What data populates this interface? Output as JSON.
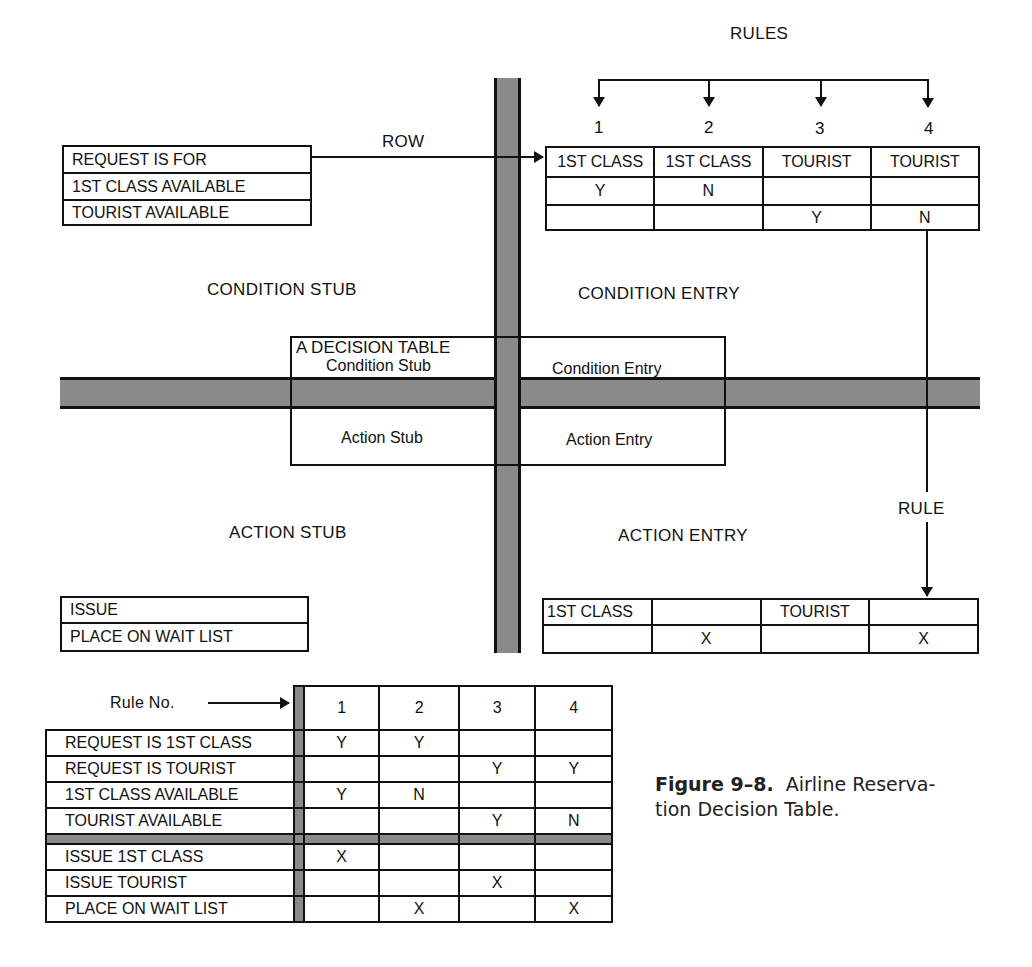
{
  "labels": {
    "rules": "RULES",
    "row": "ROW",
    "rule": "RULE",
    "condition_stub": "CONDITION STUB",
    "condition_entry": "CONDITION ENTRY",
    "action_stub": "ACTION STUB",
    "action_entry": "ACTION ENTRY"
  },
  "rule_numbers": [
    "1",
    "2",
    "3",
    "4"
  ],
  "condition_stub_rows": [
    "REQUEST IS FOR",
    "1ST CLASS AVAILABLE",
    "TOURIST AVAILABLE"
  ],
  "condition_entry_rows": [
    [
      "1ST CLASS",
      "1ST CLASS",
      "TOURIST",
      "TOURIST"
    ],
    [
      "Y",
      "N",
      "",
      ""
    ],
    [
      "",
      "",
      "Y",
      "N"
    ]
  ],
  "center_box": {
    "title": "A DECISION TABLE",
    "condition_stub": "Condition Stub",
    "condition_entry": "Condition Entry",
    "action_stub": "Action Stub",
    "action_entry": "Action Entry"
  },
  "action_stub_rows": [
    "ISSUE",
    "PLACE ON WAIT LIST"
  ],
  "action_entry_rows": [
    [
      "1ST CLASS",
      "",
      "TOURIST",
      ""
    ],
    [
      "",
      "X",
      "",
      "X"
    ]
  ],
  "full_table": {
    "header_label": "Rule No.",
    "rule_numbers": [
      "1",
      "2",
      "3",
      "4"
    ],
    "conditions": [
      {
        "stub": "REQUEST IS 1ST CLASS",
        "entries": [
          "Y",
          "Y",
          "",
          ""
        ]
      },
      {
        "stub": "REQUEST IS TOURIST",
        "entries": [
          "",
          "",
          "Y",
          "Y"
        ]
      },
      {
        "stub": "1ST CLASS AVAILABLE",
        "entries": [
          "Y",
          "N",
          "",
          ""
        ]
      },
      {
        "stub": "TOURIST AVAILABLE",
        "entries": [
          "",
          "",
          "Y",
          "N"
        ]
      }
    ],
    "actions": [
      {
        "stub": "ISSUE 1ST CLASS",
        "entries": [
          "X",
          "",
          "",
          ""
        ]
      },
      {
        "stub": "ISSUE TOURIST",
        "entries": [
          "",
          "",
          "X",
          ""
        ]
      },
      {
        "stub": "PLACE ON WAIT LIST",
        "entries": [
          "",
          "X",
          "",
          "X"
        ]
      }
    ]
  },
  "caption": {
    "figure_number": "Figure 9–8.",
    "text_line1": "Airline Reserva-",
    "text_line2": "tion Decision Table."
  },
  "colors": {
    "bar_fill": "#8a8a8a",
    "line": "#111111",
    "background": "#ffffff"
  }
}
